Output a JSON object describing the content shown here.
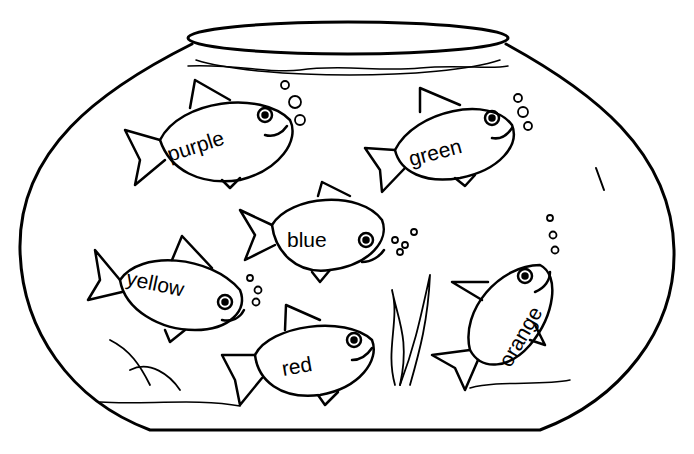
{
  "fish": [
    {
      "id": "purple",
      "label": "purple"
    },
    {
      "id": "green",
      "label": "green"
    },
    {
      "id": "blue",
      "label": "blue"
    },
    {
      "id": "yellow",
      "label": "yellow"
    },
    {
      "id": "red",
      "label": "red"
    },
    {
      "id": "orange",
      "label": "orange"
    }
  ],
  "colors": {
    "ink": "#000000",
    "paper": "#ffffff"
  }
}
